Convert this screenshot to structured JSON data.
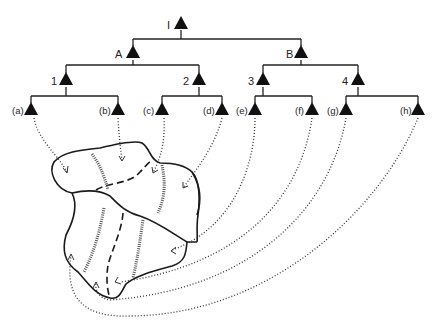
{
  "diagram": {
    "type": "hierarchy-to-map",
    "tree": {
      "root": {
        "label": "I"
      },
      "level1": [
        {
          "label": "A"
        },
        {
          "label": "B"
        }
      ],
      "level2": [
        {
          "label": "1"
        },
        {
          "label": "2"
        },
        {
          "label": "3"
        },
        {
          "label": "4"
        }
      ],
      "leaves": [
        {
          "label": "(a)"
        },
        {
          "label": "(b)"
        },
        {
          "label": "(c)"
        },
        {
          "label": "(d)"
        },
        {
          "label": "(e)"
        },
        {
          "label": "(f)"
        },
        {
          "label": "(g)"
        },
        {
          "label": "(h)"
        }
      ]
    },
    "map": {
      "description": "Irregular region divided into sub-areas by solid, dashed and hatched boundaries; dotted arrows link each leaf node to a sub-area"
    },
    "caption_visible": "partially cropped caption at bottom edge"
  }
}
